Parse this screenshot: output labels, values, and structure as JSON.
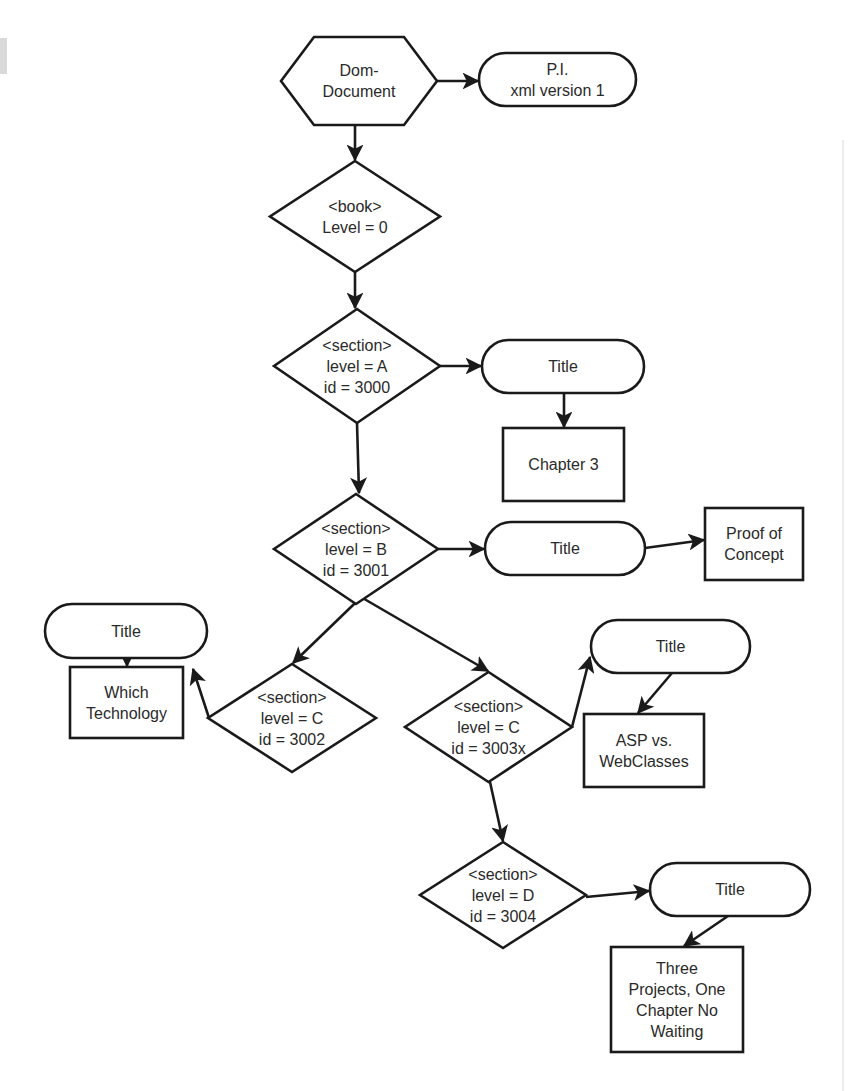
{
  "diagram": {
    "type": "flowchart",
    "colors": {
      "stroke": "#1a1a1a",
      "text": "#2a2a2a",
      "fill": "#ffffff",
      "background": "#ffffff"
    },
    "nodes": [
      {
        "id": "dom",
        "shape": "hexagon",
        "lines": [
          "Dom-",
          "Document"
        ],
        "x": 281,
        "y": 37,
        "w": 156,
        "h": 88
      },
      {
        "id": "pi",
        "shape": "pill",
        "lines": [
          "P.I.",
          "xml version 1"
        ],
        "x": 479,
        "y": 53,
        "w": 157,
        "h": 53
      },
      {
        "id": "book",
        "shape": "diamond",
        "lines": [
          "<book>",
          "Level = 0"
        ],
        "x": 270,
        "y": 161,
        "w": 170,
        "h": 111
      },
      {
        "id": "secA",
        "shape": "diamond",
        "lines": [
          "<section>",
          "level = A",
          "id = 3000"
        ],
        "x": 274,
        "y": 309,
        "w": 166,
        "h": 114
      },
      {
        "id": "titleA",
        "shape": "pill",
        "lines": [
          "Title"
        ],
        "x": 482,
        "y": 340,
        "w": 162,
        "h": 53
      },
      {
        "id": "ch3",
        "shape": "rect",
        "lines": [
          "Chapter 3"
        ],
        "x": 503,
        "y": 428,
        "w": 121,
        "h": 73
      },
      {
        "id": "secB",
        "shape": "diamond",
        "lines": [
          "<section>",
          "level = B",
          "id = 3001"
        ],
        "x": 274,
        "y": 494,
        "w": 164,
        "h": 110
      },
      {
        "id": "titleB",
        "shape": "pill",
        "lines": [
          "Title"
        ],
        "x": 485,
        "y": 522,
        "w": 160,
        "h": 53
      },
      {
        "id": "poc",
        "shape": "rect",
        "lines": [
          "Proof of",
          "Concept"
        ],
        "x": 705,
        "y": 508,
        "w": 98,
        "h": 72
      },
      {
        "id": "titleC1",
        "shape": "pill",
        "lines": [
          "Title"
        ],
        "x": 45,
        "y": 604,
        "w": 162,
        "h": 54
      },
      {
        "id": "whichTech",
        "shape": "rect",
        "lines": [
          "Which",
          "Technology"
        ],
        "x": 70,
        "y": 667,
        "w": 113,
        "h": 71
      },
      {
        "id": "secC1",
        "shape": "diamond",
        "lines": [
          "<section>",
          "level = C",
          "id = 3002"
        ],
        "x": 208,
        "y": 664,
        "w": 168,
        "h": 108
      },
      {
        "id": "secC2",
        "shape": "diamond",
        "lines": [
          "<section>",
          "level = C",
          "id = 3003x"
        ],
        "x": 405,
        "y": 672,
        "w": 167,
        "h": 110
      },
      {
        "id": "titleC2",
        "shape": "pill",
        "lines": [
          "Title"
        ],
        "x": 591,
        "y": 620,
        "w": 159,
        "h": 53
      },
      {
        "id": "asp",
        "shape": "rect",
        "lines": [
          "ASP vs.",
          "WebClasses"
        ],
        "x": 584,
        "y": 714,
        "w": 120,
        "h": 73
      },
      {
        "id": "secD",
        "shape": "diamond",
        "lines": [
          "<section>",
          "level = D",
          "id = 3004"
        ],
        "x": 420,
        "y": 842,
        "w": 166,
        "h": 106
      },
      {
        "id": "titleD",
        "shape": "pill",
        "lines": [
          "Title"
        ],
        "x": 650,
        "y": 863,
        "w": 160,
        "h": 53
      },
      {
        "id": "threeProj",
        "shape": "rect",
        "lines": [
          "Three",
          "Projects, One",
          "Chapter No",
          "Waiting"
        ],
        "x": 611,
        "y": 947,
        "w": 132,
        "h": 105
      }
    ],
    "edges": [
      {
        "from": "dom",
        "to": "pi",
        "points": [
          [
            437,
            81
          ],
          [
            478,
            81
          ]
        ]
      },
      {
        "from": "dom",
        "to": "book",
        "points": [
          [
            355,
            125
          ],
          [
            355,
            160
          ]
        ]
      },
      {
        "from": "book",
        "to": "secA",
        "points": [
          [
            355,
            272
          ],
          [
            355,
            308
          ]
        ]
      },
      {
        "from": "secA",
        "to": "titleA",
        "points": [
          [
            440,
            366
          ],
          [
            481,
            366
          ]
        ]
      },
      {
        "from": "titleA",
        "to": "ch3",
        "points": [
          [
            564,
            393
          ],
          [
            564,
            427
          ]
        ]
      },
      {
        "from": "secA",
        "to": "secB",
        "points": [
          [
            357,
            423
          ],
          [
            359,
            493
          ]
        ]
      },
      {
        "from": "secB",
        "to": "titleB",
        "points": [
          [
            438,
            549
          ],
          [
            484,
            549
          ]
        ]
      },
      {
        "from": "titleB",
        "to": "poc",
        "points": [
          [
            645,
            548
          ],
          [
            704,
            540
          ]
        ]
      },
      {
        "from": "secB",
        "to": "secC1",
        "points": [
          [
            380,
            579
          ],
          [
            293,
            663
          ]
        ]
      },
      {
        "from": "secB",
        "to": "secC2",
        "points": [
          [
            330,
            579
          ],
          [
            488,
            671
          ]
        ]
      },
      {
        "from": "secC1",
        "to": "titleC1",
        "points": [
          [
            209,
            718
          ],
          [
            193,
            669
          ]
        ]
      },
      {
        "from": "titleC1",
        "to": "whichTech",
        "points": [
          [
            127,
            658
          ],
          [
            127,
            666
          ]
        ]
      },
      {
        "from": "secC2",
        "to": "titleC2",
        "points": [
          [
            572,
            727
          ],
          [
            590,
            657
          ]
        ]
      },
      {
        "from": "titleC2",
        "to": "asp",
        "points": [
          [
            672,
            673
          ],
          [
            638,
            713
          ]
        ]
      },
      {
        "from": "secC2",
        "to": "secD",
        "points": [
          [
            490,
            782
          ],
          [
            503,
            841
          ]
        ]
      },
      {
        "from": "secD",
        "to": "titleD",
        "points": [
          [
            586,
            897
          ],
          [
            649,
            891
          ]
        ]
      },
      {
        "from": "titleD",
        "to": "threeProj",
        "points": [
          [
            728,
            916
          ],
          [
            684,
            946
          ]
        ]
      }
    ]
  }
}
